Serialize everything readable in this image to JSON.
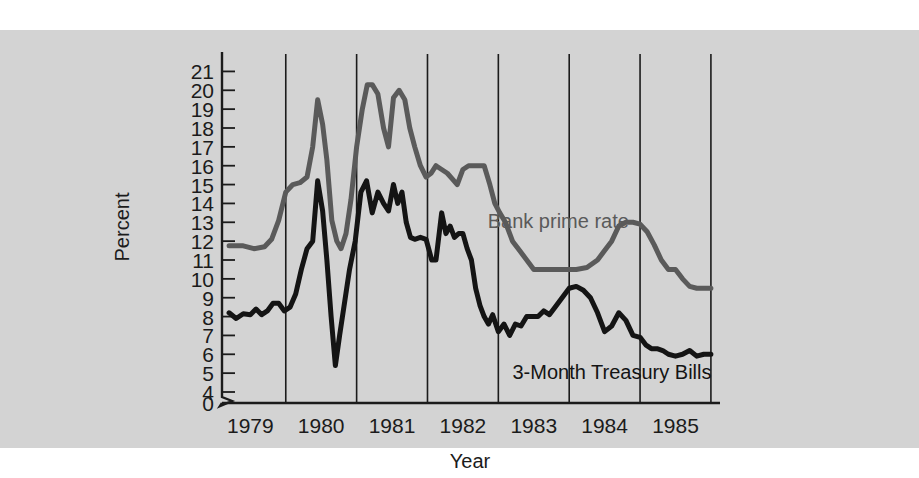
{
  "figure": {
    "background_color": "#ffffff",
    "panel_color": "#d3d3d3"
  },
  "chart_data": {
    "type": "line",
    "title": "",
    "xlabel": "Year",
    "ylabel": "Percent",
    "xlim": [
      1978.6,
      1985.6
    ],
    "ylim": [
      4,
      21.5
    ],
    "yaxis_break": true,
    "yaxis_break_from": 0,
    "yaxis_break_to": 4,
    "grid": "vertical-only",
    "gridlines_x": [
      1979.5,
      1980.5,
      1981.5,
      1982.5,
      1983.5,
      1984.5,
      1985.5
    ],
    "legend_position": "inline-annotations",
    "ytick_labels": [
      "21",
      "20",
      "19",
      "18",
      "17",
      "16",
      "15",
      "14",
      "13",
      "12",
      "11",
      "10",
      "9",
      "8",
      "7",
      "6",
      "5",
      "4",
      "0"
    ],
    "ytick_values": [
      21,
      20,
      19,
      18,
      17,
      16,
      15,
      14,
      13,
      12,
      11,
      10,
      9,
      8,
      7,
      6,
      5,
      4,
      0
    ],
    "xtick_labels": [
      "1979",
      "1980",
      "1981",
      "1982",
      "1983",
      "1984",
      "1985"
    ],
    "xtick_values": [
      1979,
      1980,
      1981,
      1982,
      1983,
      1984,
      1985
    ],
    "series": [
      {
        "name": "Bank prime rate",
        "color": "#5a5a5a",
        "linewidth": 5,
        "label_x": 1982.35,
        "label_y": 13.6,
        "x": [
          1978.7,
          1978.9,
          1979.05,
          1979.2,
          1979.3,
          1979.4,
          1979.5,
          1979.6,
          1979.7,
          1979.8,
          1979.88,
          1979.95,
          1980.02,
          1980.08,
          1980.15,
          1980.22,
          1980.28,
          1980.35,
          1980.42,
          1980.5,
          1980.58,
          1980.65,
          1980.72,
          1980.8,
          1980.88,
          1980.95,
          1981.02,
          1981.1,
          1981.18,
          1981.25,
          1981.32,
          1981.4,
          1981.48,
          1981.55,
          1981.62,
          1981.7,
          1981.78,
          1981.85,
          1981.92,
          1982.0,
          1982.08,
          1982.15,
          1982.22,
          1982.3,
          1982.38,
          1982.45,
          1982.52,
          1982.6,
          1982.7,
          1982.8,
          1982.9,
          1983.0,
          1983.15,
          1983.3,
          1983.45,
          1983.6,
          1983.75,
          1983.9,
          1984.0,
          1984.1,
          1984.2,
          1984.3,
          1984.4,
          1984.5,
          1984.6,
          1984.7,
          1984.8,
          1984.9,
          1985.0,
          1985.1,
          1985.2,
          1985.3,
          1985.4,
          1985.5
        ],
        "y": [
          11.75,
          11.75,
          11.6,
          11.7,
          12.1,
          13.1,
          14.6,
          15.0,
          15.1,
          15.4,
          17.0,
          19.5,
          18.2,
          16.3,
          13.1,
          12.0,
          11.6,
          12.4,
          14.2,
          17.0,
          19.0,
          20.3,
          20.3,
          19.8,
          18.0,
          17.0,
          19.6,
          20.0,
          19.5,
          18.0,
          17.0,
          16.0,
          15.4,
          15.6,
          16.0,
          15.8,
          15.6,
          15.3,
          15.0,
          15.8,
          16.0,
          16.0,
          16.0,
          16.0,
          15.0,
          14.0,
          13.5,
          13.0,
          12.0,
          11.5,
          11.0,
          10.5,
          10.5,
          10.5,
          10.5,
          10.5,
          10.6,
          11.0,
          11.5,
          12.0,
          12.8,
          13.0,
          13.0,
          12.9,
          12.5,
          11.8,
          11.0,
          10.5,
          10.5,
          10.0,
          9.6,
          9.5,
          9.5,
          9.5
        ]
      },
      {
        "name": "3-Month Treasury Bills",
        "color": "#141414",
        "linewidth": 5,
        "label_x": 1982.7,
        "label_y": 5.6,
        "x": [
          1978.7,
          1978.8,
          1978.9,
          1979.0,
          1979.08,
          1979.16,
          1979.24,
          1979.32,
          1979.4,
          1979.48,
          1979.56,
          1979.64,
          1979.72,
          1979.8,
          1979.88,
          1979.95,
          1980.02,
          1980.08,
          1980.14,
          1980.2,
          1980.26,
          1980.32,
          1980.4,
          1980.48,
          1980.56,
          1980.64,
          1980.72,
          1980.8,
          1980.88,
          1980.95,
          1981.02,
          1981.08,
          1981.14,
          1981.2,
          1981.26,
          1981.32,
          1981.4,
          1981.48,
          1981.56,
          1981.62,
          1981.7,
          1981.76,
          1981.82,
          1981.88,
          1981.94,
          1982.0,
          1982.06,
          1982.12,
          1982.18,
          1982.24,
          1982.3,
          1982.36,
          1982.42,
          1982.5,
          1982.58,
          1982.66,
          1982.74,
          1982.82,
          1982.9,
          1982.98,
          1983.06,
          1983.14,
          1983.22,
          1983.3,
          1983.4,
          1983.5,
          1983.6,
          1983.7,
          1983.8,
          1983.9,
          1984.0,
          1984.1,
          1984.2,
          1984.3,
          1984.4,
          1984.5,
          1984.58,
          1984.66,
          1984.74,
          1984.82,
          1984.9,
          1985.0,
          1985.1,
          1985.2,
          1985.3,
          1985.4,
          1985.5
        ],
        "y": [
          8.2,
          7.9,
          8.15,
          8.1,
          8.4,
          8.1,
          8.3,
          8.7,
          8.7,
          8.3,
          8.5,
          9.2,
          10.5,
          11.6,
          12.0,
          15.2,
          13.6,
          11.0,
          8.0,
          5.4,
          7.0,
          8.5,
          10.5,
          12.0,
          14.6,
          15.2,
          13.5,
          14.6,
          14.0,
          13.6,
          15.0,
          14.0,
          14.6,
          13.0,
          12.2,
          12.1,
          12.2,
          12.1,
          11.0,
          11.0,
          13.5,
          12.4,
          12.8,
          12.2,
          12.4,
          12.4,
          11.6,
          11.0,
          9.5,
          8.6,
          8.0,
          7.6,
          8.1,
          7.2,
          7.6,
          7.0,
          7.6,
          7.5,
          8.0,
          8.0,
          8.0,
          8.3,
          8.1,
          8.5,
          9.0,
          9.5,
          9.6,
          9.4,
          9.0,
          8.2,
          7.2,
          7.5,
          8.2,
          7.8,
          7.0,
          6.9,
          6.5,
          6.3,
          6.3,
          6.2,
          6.0,
          5.9,
          6.0,
          6.2,
          5.9,
          6.0,
          6.0
        ]
      }
    ]
  },
  "axes": {
    "y_axis_title": "Percent",
    "x_axis_title": "Year"
  }
}
